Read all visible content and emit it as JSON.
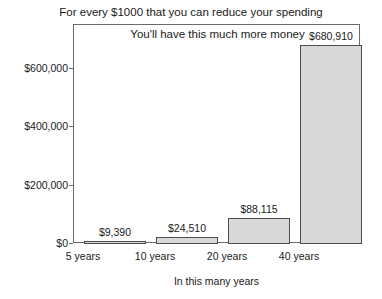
{
  "chart_data": {
    "type": "bar",
    "title": "For every $1000 that you can reduce your spending",
    "subtitle": "You'll have this much more money",
    "xlabel": "In this many years",
    "ylabel": "",
    "categories": [
      "5 years",
      "10 years",
      "20 years",
      "40 years"
    ],
    "values": [
      9390,
      24510,
      88115,
      680910
    ],
    "value_labels": [
      "$9,390",
      "$24,510",
      "$88,115",
      "$680,910"
    ],
    "ylim": [
      0,
      686000
    ],
    "yticks": [
      0,
      200000,
      400000,
      600000
    ],
    "ytick_labels": [
      "$0",
      "$200,000",
      "$400,000",
      "$600,000"
    ],
    "grid": false,
    "legend": null,
    "bar_fill_color": "#d9d9d9",
    "bar_border_color": "#4d4d4d",
    "frame_color": "#6b6b6b",
    "text_color": "#1a1a1a",
    "background_color": "#ffffff"
  }
}
